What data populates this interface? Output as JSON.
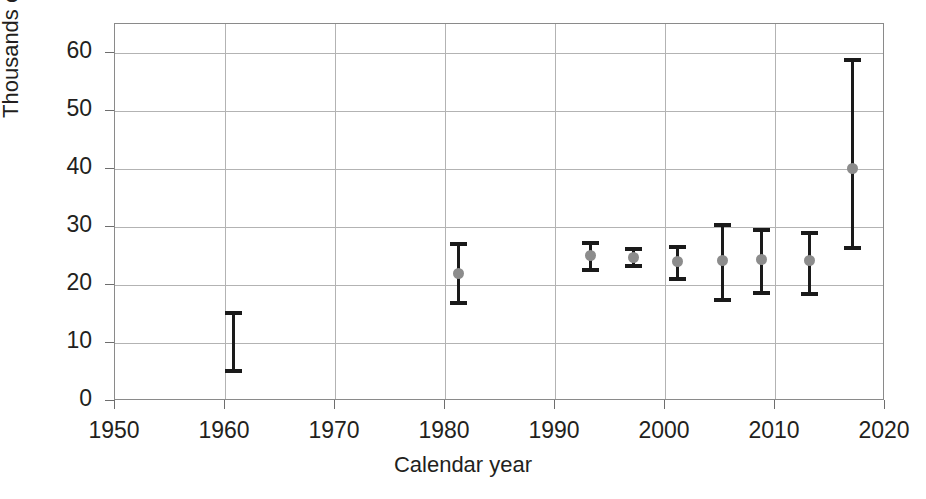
{
  "caption_sliver": "",
  "chart_data": {
    "type": "scatter",
    "title": "",
    "subtitle": "",
    "xlabel": "Calendar year",
    "ylabel": "Thousands of bears",
    "xlim": [
      1950,
      2020
    ],
    "ylim": [
      0,
      65
    ],
    "grid": true,
    "legend": null,
    "xticks": [
      1950,
      1960,
      1970,
      1980,
      1990,
      2000,
      2010,
      2020
    ],
    "xtick_labels": [
      "1950",
      "1960",
      "1970",
      "1980",
      "1990",
      "2000",
      "2010",
      "2020"
    ],
    "yticks": [
      0,
      10,
      20,
      30,
      40,
      50,
      60
    ],
    "ytick_labels": [
      "0",
      "10",
      "20",
      "30",
      "40",
      "50",
      "60"
    ],
    "marker_color": "#8c8c8c",
    "errorbar_color": "#1a1a1a",
    "grid_color": "#b3b3b3",
    "axis_color": "#8a8a8a",
    "series": [
      {
        "name": "Estimated bear abundance",
        "points": [
          {
            "x": 1960.8,
            "y": null,
            "low": 5.2,
            "high": 15.2,
            "has_marker": false
          },
          {
            "x": 1981.2,
            "y": 22.0,
            "low": 16.9,
            "high": 27.0,
            "has_marker": true
          },
          {
            "x": 1993.2,
            "y": 25.0,
            "low": 22.5,
            "high": 27.2,
            "has_marker": true
          },
          {
            "x": 1997.1,
            "y": 24.8,
            "low": 23.2,
            "high": 26.2,
            "has_marker": true
          },
          {
            "x": 2001.1,
            "y": 24.0,
            "low": 21.0,
            "high": 26.6,
            "has_marker": true
          },
          {
            "x": 2005.2,
            "y": 24.2,
            "low": 17.4,
            "high": 30.4,
            "has_marker": true
          },
          {
            "x": 2008.8,
            "y": 24.4,
            "low": 18.6,
            "high": 29.4,
            "has_marker": true
          },
          {
            "x": 2013.1,
            "y": 24.2,
            "low": 18.4,
            "high": 28.9,
            "has_marker": true
          },
          {
            "x": 2017.0,
            "y": 40.0,
            "low": 26.3,
            "high": 58.8,
            "has_marker": true
          }
        ]
      }
    ]
  }
}
